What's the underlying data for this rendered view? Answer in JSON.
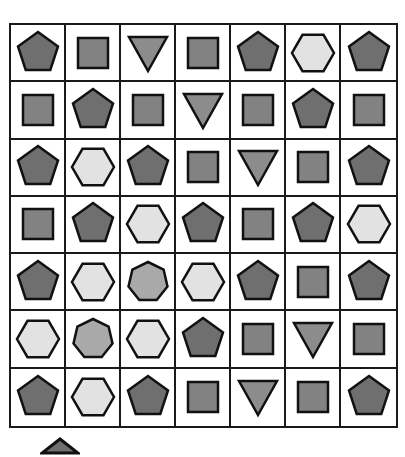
{
  "colors": {
    "pentagon": "#6f6f6f",
    "square": "#828282",
    "triangle": "#8c8c8c",
    "hexagon": "#e2e2e2",
    "heptagon": "#a9a9a9",
    "stroke": "#111111"
  },
  "grid": {
    "rows": 7,
    "cols": 7,
    "cells": [
      [
        "pentagon",
        "square",
        "triangle",
        "square",
        "pentagon",
        "hexagon",
        "pentagon"
      ],
      [
        "square",
        "pentagon",
        "square",
        "triangle",
        "square",
        "pentagon",
        "square"
      ],
      [
        "pentagon",
        "hexagon",
        "pentagon",
        "square",
        "triangle",
        "square",
        "pentagon"
      ],
      [
        "square",
        "pentagon",
        "hexagon",
        "pentagon",
        "square",
        "pentagon",
        "hexagon"
      ],
      [
        "pentagon",
        "hexagon",
        "heptagon",
        "hexagon",
        "pentagon",
        "square",
        "pentagon"
      ],
      [
        "hexagon",
        "heptagon",
        "hexagon",
        "pentagon",
        "square",
        "triangle",
        "square"
      ],
      [
        "pentagon",
        "hexagon",
        "pentagon",
        "square",
        "triangle",
        "square",
        "pentagon"
      ]
    ]
  },
  "below_grid": {
    "partial_shape": "pentagon"
  }
}
